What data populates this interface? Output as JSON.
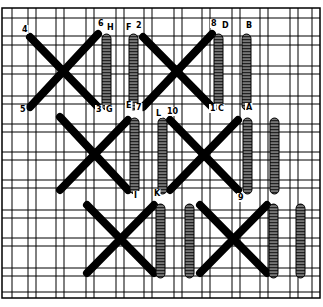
{
  "diagram": {
    "type": "needlework-stitch-diagram",
    "colors": {
      "ink": "#000000",
      "paper": "#ffffff"
    },
    "labels": [
      {
        "text": "4",
        "x": 22,
        "y": 32
      },
      {
        "text": "6",
        "x": 98,
        "y": 26
      },
      {
        "text": "H",
        "x": 107,
        "y": 30
      },
      {
        "text": "F",
        "x": 126,
        "y": 30
      },
      {
        "text": "2",
        "x": 136,
        "y": 28
      },
      {
        "text": "8",
        "x": 211,
        "y": 26
      },
      {
        "text": "D",
        "x": 222,
        "y": 28
      },
      {
        "text": "B",
        "x": 246,
        "y": 28
      },
      {
        "text": "5",
        "x": 20,
        "y": 112
      },
      {
        "text": "3",
        "x": 96,
        "y": 112
      },
      {
        "text": "G",
        "x": 106,
        "y": 112
      },
      {
        "text": "E",
        "x": 126,
        "y": 108
      },
      {
        "text": "7",
        "x": 136,
        "y": 110
      },
      {
        "text": "L",
        "x": 156,
        "y": 116
      },
      {
        "text": "10",
        "x": 167,
        "y": 114
      },
      {
        "text": "1",
        "x": 210,
        "y": 111
      },
      {
        "text": "C",
        "x": 218,
        "y": 111
      },
      {
        "text": "A",
        "x": 246,
        "y": 110
      },
      {
        "text": "I",
        "x": 134,
        "y": 198
      },
      {
        "text": "K",
        "x": 154,
        "y": 196
      },
      {
        "text": "9",
        "x": 238,
        "y": 200
      }
    ]
  }
}
